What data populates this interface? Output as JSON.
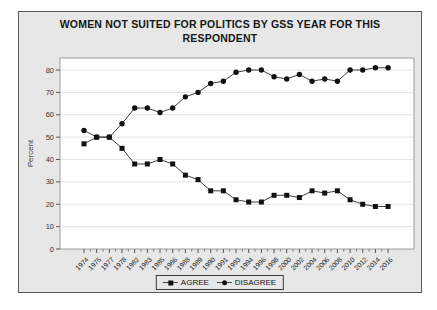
{
  "window": {
    "background_color": "#ffffff",
    "panel_background": "#e7e7e7",
    "panel_border_color": "#5a5a5a"
  },
  "chart_data": {
    "type": "line",
    "title": "WOMEN NOT SUITED FOR POLITICS BY GSS YEAR FOR THIS RESPONDENT",
    "xlabel": "",
    "ylabel": "Percent",
    "ylim": [
      0,
      85
    ],
    "yticks": [
      0,
      10,
      20,
      30,
      40,
      50,
      60,
      70,
      80
    ],
    "grid": true,
    "legend_position": "bottom-center",
    "plot_background": "#ffffff",
    "gridline_color": "#e2e2e2",
    "axis_color": "#9c9c9c",
    "line_color": "#3f3f3f",
    "marker_color": "#111111",
    "categories": [
      "1974",
      "1975",
      "1977",
      "1978",
      "1982",
      "1983",
      "1985",
      "1986",
      "1988",
      "1989",
      "1990",
      "1991",
      "1993",
      "1994",
      "1996",
      "1998",
      "2000",
      "2002",
      "2004",
      "2006",
      "2008",
      "2010",
      "2012",
      "2014",
      "2016"
    ],
    "series": [
      {
        "name": "AGREE",
        "marker": "square",
        "values": [
          47,
          50,
          50,
          45,
          38,
          38,
          40,
          38,
          33,
          31,
          26,
          26,
          22,
          21,
          21,
          24,
          24,
          23,
          26,
          25,
          26,
          22,
          20,
          19,
          19
        ]
      },
      {
        "name": "DISAGREE",
        "marker": "circle",
        "values": [
          53,
          50,
          50,
          56,
          63,
          63,
          61,
          63,
          68,
          70,
          74,
          75,
          79,
          80,
          80,
          77,
          76,
          78,
          75,
          76,
          75,
          80,
          80,
          81,
          81
        ]
      }
    ]
  }
}
